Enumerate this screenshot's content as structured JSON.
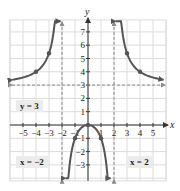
{
  "chart_data": {
    "type": "line",
    "title": "",
    "xlabel": "x",
    "ylabel": "y",
    "xlim": [
      -6,
      6
    ],
    "ylim": [
      -4.2,
      7.9
    ],
    "grid": true,
    "x_ticks": [
      -5,
      -4,
      -3,
      -2,
      -1,
      1,
      2,
      3,
      4,
      5
    ],
    "y_ticks": [
      -3,
      -2,
      -1,
      1,
      2,
      3,
      4,
      5,
      6,
      7
    ],
    "x_tick_labels": [
      "−5",
      "−4",
      "−3",
      "−2",
      "−1",
      "1",
      "2",
      "3",
      "4",
      "5"
    ],
    "y_tick_labels": [
      "−3",
      "−2",
      "−1",
      "1",
      "2",
      "3",
      "4",
      "5",
      "6",
      "7"
    ],
    "function": "f(x) = 3x^2 / (x^2 - 4)",
    "series": [
      {
        "name": "left branch",
        "x_range": [
          -5.8,
          -2.12
        ],
        "points": [
          [
            -4,
            4
          ],
          [
            -3,
            5.4
          ]
        ]
      },
      {
        "name": "middle branch",
        "x_range": [
          -1.72,
          1.72
        ],
        "points": [
          [
            -1,
            -1
          ],
          [
            0,
            0
          ],
          [
            1,
            -1
          ]
        ]
      },
      {
        "name": "right branch",
        "x_range": [
          2.12,
          5.8
        ],
        "points": [
          [
            3,
            5.4
          ],
          [
            4,
            4
          ]
        ]
      }
    ],
    "asymptotes": [
      {
        "type": "horizontal",
        "value": 3,
        "label": "y = 3"
      },
      {
        "type": "vertical",
        "value": -2,
        "label": "x = −2"
      },
      {
        "type": "vertical",
        "value": 2,
        "label": "x = 2"
      }
    ],
    "colors": {
      "curve": "#555555",
      "asymptote": "#8a8a8a",
      "grid": "#dcdcdc",
      "axis": "#333333"
    }
  },
  "labels": {
    "h_asymptote": "y = 3",
    "v_asymptote_left": "x = −2",
    "v_asymptote_right": "x = 2"
  }
}
